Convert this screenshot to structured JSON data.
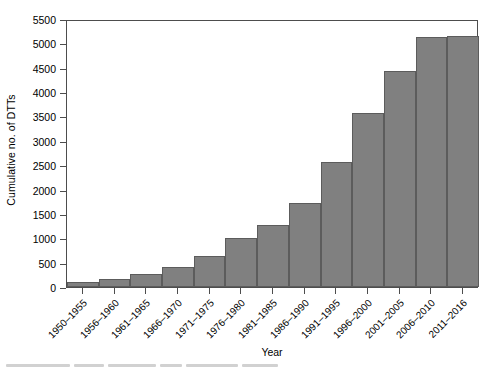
{
  "chart_data": {
    "type": "bar",
    "title": "",
    "subtitle": "",
    "xlabel": "Year",
    "ylabel": "Cumulative no. of DTTs",
    "categories": [
      "1950–1955",
      "1956–1960",
      "1961–1965",
      "1966–1970",
      "1971–1975",
      "1976–1980",
      "1981–1985",
      "1986–1990",
      "1991–1995",
      "1996–2000",
      "2001–2005",
      "2006–2010",
      "2011–2016"
    ],
    "values": [
      100,
      165,
      270,
      410,
      640,
      1010,
      1280,
      1730,
      2570,
      3570,
      4440,
      5140,
      5160
    ],
    "ylim": [
      0,
      5500
    ],
    "yticks": [
      0,
      500,
      1000,
      1500,
      2000,
      2500,
      3000,
      3500,
      4000,
      4500,
      5000,
      5500
    ],
    "ytick_labels": [
      "0",
      "500",
      "1000",
      "1500",
      "2000",
      "2500",
      "3000",
      "3500",
      "4000",
      "4500",
      "5000",
      "5500"
    ],
    "grid": false,
    "legend": null,
    "bar_color": "#808080",
    "bar_border_color": "#5c5c5c",
    "axis_color": "#4d4d4d"
  }
}
